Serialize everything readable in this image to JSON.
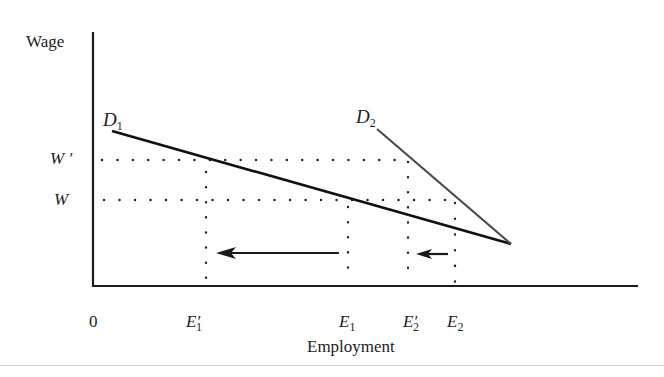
{
  "diagram": {
    "y_axis_label": "Wage",
    "x_axis_label": "Employment",
    "origin_label": "0",
    "wage_levels": [
      {
        "symbol": "W",
        "prime": "′",
        "y": 160
      },
      {
        "symbol": "W",
        "prime": "",
        "y": 200
      }
    ],
    "curves": [
      {
        "name": "D",
        "sub": "1",
        "from": [
          112,
          130
        ],
        "to": [
          511,
          244
        ],
        "color": "#111"
      },
      {
        "name": "D",
        "sub": "2",
        "from": [
          377,
          128
        ],
        "to": [
          511,
          244
        ],
        "color": "#444"
      }
    ],
    "employment_points": [
      {
        "symbol": "E",
        "sub": "1",
        "prime": "′",
        "x": 206
      },
      {
        "symbol": "E",
        "sub": "1",
        "prime": "",
        "x": 348
      },
      {
        "symbol": "E",
        "sub": "2",
        "prime": "′",
        "x": 408
      },
      {
        "symbol": "E",
        "sub": "2",
        "prime": "",
        "x": 455
      }
    ],
    "arrows": [
      {
        "from_label": "E1",
        "to_label": "E1′",
        "from_x": 340,
        "to_x": 216,
        "y": 253
      },
      {
        "from_label": "E2",
        "to_label": "E2′",
        "from_x": 448,
        "to_x": 416,
        "y": 253
      }
    ],
    "labels": {
      "d1": "D",
      "d1_sub": "1",
      "d2": "D",
      "d2_sub": "2",
      "w_prime": "W ′",
      "w": "W",
      "e1_prime": "E",
      "e1_prime_sub": "1",
      "e1": "E",
      "e1_sub": "1",
      "e2_prime": "E",
      "e2_prime_sub": "2",
      "e2": "E",
      "e2_sub": "2",
      "prime": "′"
    }
  }
}
